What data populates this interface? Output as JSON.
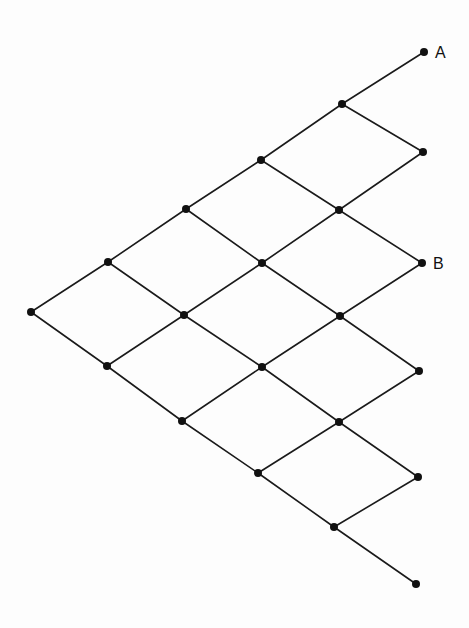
{
  "diagram": {
    "type": "lattice-path-grid",
    "width": 469,
    "height": 628,
    "colors": {
      "background": "#fdfdfd",
      "line": "#1a1a1a",
      "node": "#111111"
    },
    "node_radius": 4,
    "nodes": [
      {
        "id": "n0",
        "x": 31,
        "y": 312
      },
      {
        "id": "n1",
        "x": 108,
        "y": 262
      },
      {
        "id": "n2",
        "x": 107,
        "y": 366
      },
      {
        "id": "n3",
        "x": 186,
        "y": 209
      },
      {
        "id": "n4",
        "x": 184,
        "y": 315
      },
      {
        "id": "n5",
        "x": 182,
        "y": 421
      },
      {
        "id": "n6",
        "x": 261,
        "y": 160
      },
      {
        "id": "n7",
        "x": 262,
        "y": 263
      },
      {
        "id": "n8",
        "x": 262,
        "y": 367
      },
      {
        "id": "n9",
        "x": 258,
        "y": 473
      },
      {
        "id": "n10",
        "x": 342,
        "y": 104
      },
      {
        "id": "n11",
        "x": 339,
        "y": 210
      },
      {
        "id": "n12",
        "x": 340,
        "y": 316
      },
      {
        "id": "n13",
        "x": 339,
        "y": 422
      },
      {
        "id": "n14",
        "x": 334,
        "y": 527
      },
      {
        "id": "A",
        "x": 424,
        "y": 52,
        "label": "A"
      },
      {
        "id": "n16",
        "x": 423,
        "y": 152
      },
      {
        "id": "B",
        "x": 422,
        "y": 263,
        "label": "B"
      },
      {
        "id": "n18",
        "x": 419,
        "y": 371
      },
      {
        "id": "n19",
        "x": 418,
        "y": 477
      },
      {
        "id": "n20",
        "x": 416,
        "y": 584
      }
    ],
    "edges": [
      [
        "n0",
        "n1"
      ],
      [
        "n0",
        "n2"
      ],
      [
        "n1",
        "n3"
      ],
      [
        "n1",
        "n4"
      ],
      [
        "n2",
        "n4"
      ],
      [
        "n2",
        "n5"
      ],
      [
        "n3",
        "n6"
      ],
      [
        "n3",
        "n7"
      ],
      [
        "n4",
        "n7"
      ],
      [
        "n4",
        "n8"
      ],
      [
        "n5",
        "n8"
      ],
      [
        "n5",
        "n9"
      ],
      [
        "n6",
        "n10"
      ],
      [
        "n6",
        "n11"
      ],
      [
        "n7",
        "n11"
      ],
      [
        "n7",
        "n12"
      ],
      [
        "n8",
        "n12"
      ],
      [
        "n8",
        "n13"
      ],
      [
        "n9",
        "n13"
      ],
      [
        "n9",
        "n14"
      ],
      [
        "n10",
        "A"
      ],
      [
        "n10",
        "n16"
      ],
      [
        "n11",
        "n16"
      ],
      [
        "n11",
        "B"
      ],
      [
        "n12",
        "B"
      ],
      [
        "n12",
        "n18"
      ],
      [
        "n13",
        "n18"
      ],
      [
        "n13",
        "n19"
      ],
      [
        "n14",
        "n19"
      ],
      [
        "n14",
        "n20"
      ]
    ],
    "labels": [
      {
        "text": "A",
        "node": "A",
        "dx": 11,
        "dy": 6
      },
      {
        "text": "B",
        "node": "B",
        "dx": 11,
        "dy": 6
      }
    ]
  }
}
